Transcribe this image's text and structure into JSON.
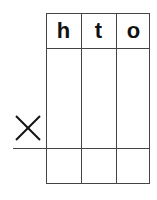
{
  "headers": [
    "h",
    "t",
    "o"
  ],
  "operator": "×",
  "operator_icon": "multiply-icon"
}
